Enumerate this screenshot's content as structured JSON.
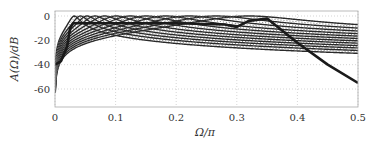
{
  "chart_data": {
    "type": "line",
    "title": "",
    "xlabel": "Ω/π",
    "ylabel": "A(Ω)/dB",
    "xlim": [
      0,
      0.5
    ],
    "ylim": [
      -75,
      3
    ],
    "xticks": [
      0,
      0.1,
      0.2,
      0.3,
      0.4,
      0.5
    ],
    "xtick_labels": [
      "0",
      "0.1",
      "0.2",
      "0.3",
      "0.4",
      "0.5"
    ],
    "yticks": [
      0,
      -20,
      -40,
      -60
    ],
    "ytick_labels": [
      "0",
      "-20",
      "-40",
      "-60"
    ],
    "grid": true,
    "grid_style": "dotted",
    "legend": null,
    "series": [
      {
        "name": "solid-bands",
        "style": "solid",
        "peak_freqs": [
          0.032,
          0.042,
          0.053,
          0.066,
          0.082,
          0.101,
          0.124,
          0.151,
          0.183,
          0.221,
          0.266,
          0.32
        ],
        "peak_db": 0
      },
      {
        "name": "dotted-bands",
        "style": "dotted",
        "peak_freqs": [
          0.037,
          0.047,
          0.059,
          0.074,
          0.091,
          0.112,
          0.137,
          0.166,
          0.201,
          0.243,
          0.292
        ],
        "peak_db": 0
      },
      {
        "name": "overall-envelope",
        "style": "bold",
        "x": [
          0.0,
          0.01,
          0.02,
          0.025,
          0.03,
          0.1,
          0.2,
          0.28,
          0.3,
          0.32,
          0.35,
          0.4,
          0.45,
          0.5
        ],
        "y": [
          -40,
          -37,
          -25,
          -10,
          -6,
          -6,
          -6,
          -7,
          -9,
          -4,
          -2,
          -22,
          -40,
          -55
        ]
      }
    ]
  }
}
